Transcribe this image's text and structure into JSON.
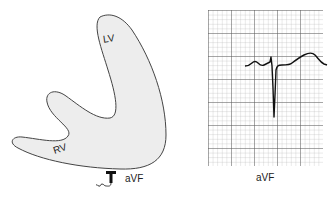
{
  "heart_diagram": {
    "lv_label": "LV",
    "rv_label": "RV",
    "lead_label": "aVF",
    "fill_color": "#ededed",
    "outline_color": "#444444"
  },
  "ecg_strip": {
    "lead_label": "aVF",
    "grid": {
      "minor_line_color": "#b8b8b8",
      "major_line_color": "#555555",
      "minor_spacing_px": 4.6,
      "major_every": 5
    },
    "trace_color": "#111111",
    "waveform": "Small P wave, small r then deep narrow QS/S complex, upsloping ST, broad upright T wave"
  }
}
